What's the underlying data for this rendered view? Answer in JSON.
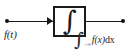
{
  "diagram": {
    "input": {
      "label": "f(t)",
      "terminal_icon": "terminal-dot-icon",
      "arrow_icon": "arrow-right-icon"
    },
    "block": {
      "symbol": "∫",
      "icon": "integral-sign-icon"
    },
    "output": {
      "terminal_icon": "terminal-dot-icon",
      "integral_sign": "∫",
      "upper_limit": "t",
      "lower_limit": "−∞",
      "integrand": "f(x)",
      "differential": "dx"
    },
    "colors": {
      "ink": "#1b1b1b",
      "background": "#ffffff",
      "label": "#2a2a2a"
    }
  }
}
